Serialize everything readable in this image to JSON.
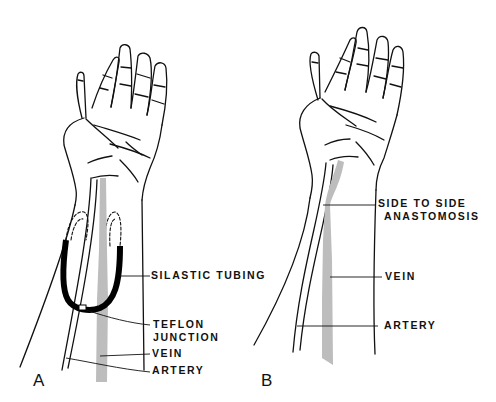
{
  "figure": {
    "panels": [
      {
        "id": "A",
        "letter": "A",
        "labels": {
          "silastic_tubing": "SILASTIC TUBING",
          "teflon_line1": "TEFLON",
          "teflon_line2": "JUNCTION",
          "vein": "VEIN",
          "artery": "ARTERY"
        }
      },
      {
        "id": "B",
        "letter": "B",
        "labels": {
          "anastomosis_line1": "SIDE TO SIDE",
          "anastomosis_line2": "ANASTOMOSIS",
          "vein": "VEIN",
          "artery": "ARTERY"
        }
      }
    ],
    "colors": {
      "ink": "#111111",
      "vein_fill": "#bdbdbd",
      "tubing": "#000000",
      "background": "#ffffff"
    }
  }
}
